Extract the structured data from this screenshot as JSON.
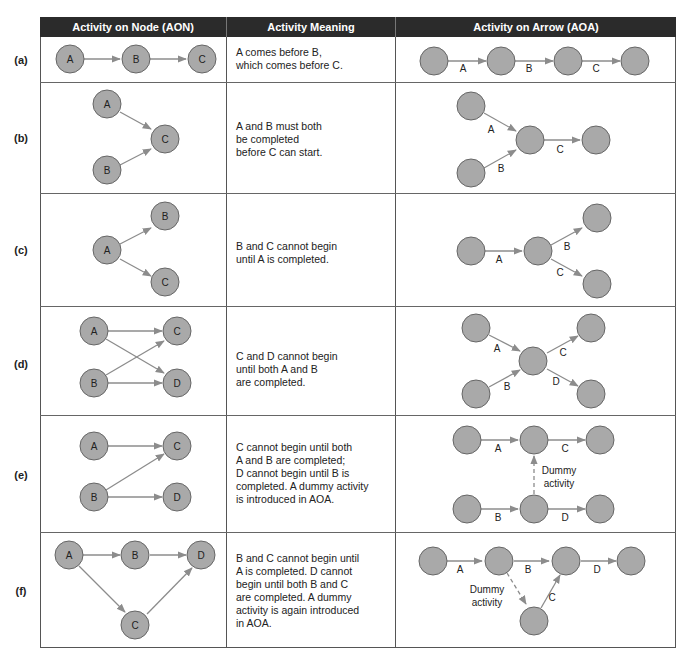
{
  "header": {
    "col1": "Activity on Node (AON)",
    "col2": "Activity Meaning",
    "col3": "Activity on Arrow (AOA)"
  },
  "rows": [
    {
      "label": "(a)",
      "meaning": "A comes before B,\nwhich comes before C."
    },
    {
      "label": "(b)",
      "meaning": "A and B must both\nbe completed\nbefore C can start."
    },
    {
      "label": "(c)",
      "meaning": "B and C cannot begin\nuntil A is completed."
    },
    {
      "label": "(d)",
      "meaning": "C and D cannot begin\nuntil both A and B\nare completed."
    },
    {
      "label": "(e)",
      "meaning": "C cannot begin until both\nA and B are completed;\nD cannot begin until B is\ncompleted. A dummy activity\nis introduced in AOA."
    },
    {
      "label": "(f)",
      "meaning": "B and C cannot begin until\nA is completed. D cannot\nbegin until both B and C\nare completed. A dummy\nactivity is again introduced\nin AOA."
    }
  ],
  "labels": {
    "A": "A",
    "B": "B",
    "C": "C",
    "D": "D",
    "dummy1": "Dummy",
    "dummy2": "activity"
  },
  "colors": {
    "header_bg": "#2b2b2b",
    "node_fill": "#a9a9a9",
    "edge": "#8c8c8c"
  }
}
